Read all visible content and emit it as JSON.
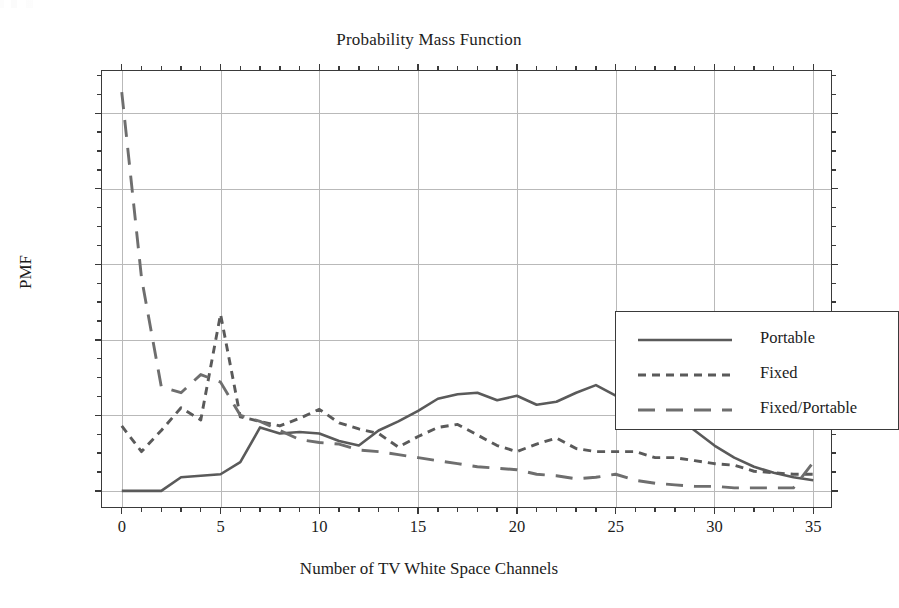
{
  "figure": {
    "title": "Probability Mass Function",
    "x_axis_title": "Number of TV White Space Channels",
    "y_axis_title": "PMF"
  },
  "axes": {
    "y_tick_labels": [
      "0.00",
      "0.05",
      "0.10",
      "0.15",
      "0.20",
      "0.25"
    ],
    "x_tick_labels": [
      "0",
      "5",
      "10",
      "15",
      "20",
      "25",
      "30",
      "35"
    ]
  },
  "legend": {
    "items": [
      {
        "label": "Portable",
        "dash": "none",
        "color": "#5a5a5a"
      },
      {
        "label": "Fixed",
        "dash": "short",
        "color": "#5a5a5a"
      },
      {
        "label": "Fixed/Portable",
        "dash": "long",
        "color": "#6e6e6e"
      }
    ]
  },
  "chart_data": {
    "type": "line",
    "title": "Probability Mass Function",
    "xlabel": "Number of TV White Space Channels",
    "ylabel": "PMF",
    "xlim": [
      -1,
      36
    ],
    "ylim": [
      -0.012,
      0.278
    ],
    "xticks": [
      0,
      5,
      10,
      15,
      20,
      25,
      30,
      35
    ],
    "yticks": [
      0.0,
      0.05,
      0.1,
      0.15,
      0.2,
      0.25
    ],
    "grid": true,
    "legend_position": "center-right",
    "x": [
      0,
      1,
      2,
      3,
      4,
      5,
      6,
      7,
      8,
      9,
      10,
      11,
      12,
      13,
      14,
      15,
      16,
      17,
      18,
      19,
      20,
      21,
      22,
      23,
      24,
      25,
      26,
      27,
      28,
      29,
      30,
      31,
      32,
      33,
      34,
      35
    ],
    "series": [
      {
        "name": "Portable",
        "dash": "none",
        "color": "#5a5a5a",
        "values": [
          0.0,
          0.0,
          0.0,
          0.009,
          0.01,
          0.011,
          0.019,
          0.042,
          0.038,
          0.039,
          0.038,
          0.033,
          0.03,
          0.04,
          0.046,
          0.053,
          0.061,
          0.064,
          0.065,
          0.06,
          0.063,
          0.057,
          0.059,
          0.065,
          0.07,
          0.063,
          0.061,
          0.061,
          0.05,
          0.04,
          0.03,
          0.022,
          0.016,
          0.012,
          0.009,
          0.007
        ]
      },
      {
        "name": "Fixed",
        "dash": "short",
        "color": "#5a5a5a",
        "values": [
          0.043,
          0.026,
          0.04,
          0.055,
          0.047,
          0.117,
          0.049,
          0.046,
          0.043,
          0.048,
          0.054,
          0.045,
          0.041,
          0.038,
          0.029,
          0.036,
          0.042,
          0.044,
          0.037,
          0.03,
          0.026,
          0.031,
          0.035,
          0.028,
          0.026,
          0.026,
          0.026,
          0.022,
          0.022,
          0.02,
          0.018,
          0.017,
          0.013,
          0.012,
          0.011,
          0.011
        ]
      },
      {
        "name": "Fixed/Portable",
        "dash": "long",
        "color": "#6e6e6e",
        "values": [
          0.264,
          0.141,
          0.069,
          0.065,
          0.077,
          0.072,
          0.05,
          0.046,
          0.04,
          0.034,
          0.032,
          0.031,
          0.027,
          0.026,
          0.024,
          0.022,
          0.02,
          0.018,
          0.016,
          0.015,
          0.014,
          0.011,
          0.01,
          0.008,
          0.009,
          0.011,
          0.007,
          0.005,
          0.004,
          0.003,
          0.003,
          0.002,
          0.002,
          0.002,
          0.002,
          0.019
        ]
      }
    ],
    "series_overrides": {
      "note": "Portable and Fixed tails merge toward 0; Fixed shows terminal uptick at x=35.",
      "portable_tail": {
        "x": [
          25,
          26,
          27,
          28,
          29,
          30,
          31,
          32,
          33,
          34,
          35
        ],
        "values": [
          0.063,
          0.061,
          0.061,
          0.05,
          0.04,
          0.03,
          0.022,
          0.016,
          0.012,
          0.009,
          0.007
        ]
      },
      "fixed_tail_uptick": {
        "x": [
          34,
          35
        ],
        "values": [
          0.002,
          0.019
        ]
      }
    }
  }
}
